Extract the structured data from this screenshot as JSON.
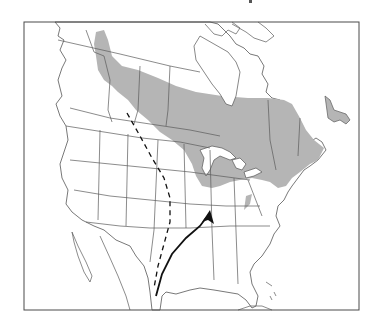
{
  "map": {
    "type": "range-and-migration-map",
    "region": "North America",
    "colors": {
      "background": "#ffffff",
      "range_fill": "#b5b5b5",
      "outline": "#555555",
      "route": "#111111"
    },
    "layers": [
      {
        "name": "breeding-range",
        "style": "gray shaded band",
        "extent": "boreal Canada from northern Rockies east to Newfoundland, south to Great Lakes and northeastern US"
      },
      {
        "name": "dashed-route",
        "style": "dashed line",
        "from": "southern Saskatchewan",
        "to": "southern Texas"
      },
      {
        "name": "solid-route-arrow",
        "style": "solid line with arrowhead",
        "from": "southern Texas coast",
        "to": "southern Illinois"
      }
    ]
  }
}
